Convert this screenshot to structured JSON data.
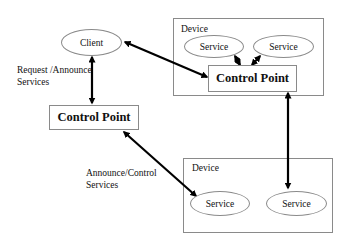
{
  "diagram": {
    "client": {
      "label": "Client"
    },
    "left_control_point": {
      "label": "Control Point"
    },
    "top_device": {
      "label": "Device",
      "services": [
        {
          "label": "Service"
        },
        {
          "label": "Service"
        }
      ],
      "control_point": {
        "label": "Control Point"
      }
    },
    "bottom_device": {
      "label": "Device",
      "services": [
        {
          "label": "Service"
        },
        {
          "label": "Service"
        }
      ]
    },
    "edge_labels": {
      "request_announce": [
        "Request /Announce",
        "Services"
      ],
      "announce_control": [
        "Announce/Control",
        "Services"
      ]
    },
    "colors": {
      "line": "#000000",
      "border": "#8a8a8a",
      "background": "#ffffff"
    }
  }
}
